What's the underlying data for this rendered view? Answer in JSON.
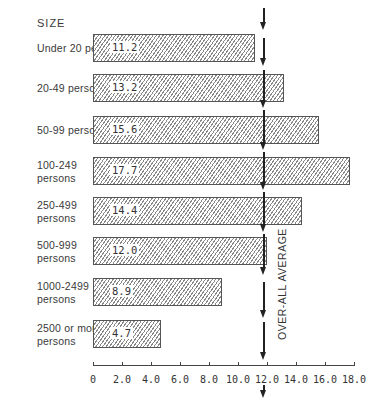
{
  "chart_data": {
    "type": "bar",
    "orientation": "horizontal",
    "title": "SIZE",
    "xlabel": "",
    "ylabel": "SIZE",
    "categories": [
      "Under 20 persons",
      "20-49 persons",
      "50-99 persons",
      "100-249 persons",
      "250-499 persons",
      "500-999 persons",
      "1000-2499 persons",
      "2500 or more persons"
    ],
    "values": [
      11.2,
      13.2,
      15.6,
      17.7,
      14.4,
      12.0,
      8.9,
      4.7
    ],
    "value_labels": [
      "11.2",
      "13.2",
      "15.6",
      "17.7",
      "14.4",
      "12.0",
      "8.9",
      "4.7"
    ],
    "xlim": [
      0,
      18.0
    ],
    "xticks": [
      "0",
      "2.0",
      "4.0",
      "6.0",
      "8.0",
      "10.0",
      "12.0",
      "14.0",
      "16.0",
      "18.0"
    ],
    "reference_line": {
      "label": "OVER-ALL AVERAGE",
      "value": 11.7
    },
    "grid": false,
    "legend": null,
    "bar_fill": "diagonal-hatch"
  },
  "labels": {
    "title": "SIZE",
    "rows": [
      {
        "line1": "Under 20 persons",
        "line2": ""
      },
      {
        "line1": "20-49 persons",
        "line2": ""
      },
      {
        "line1": "50-99 persons",
        "line2": ""
      },
      {
        "line1": "100-249",
        "line2": "persons"
      },
      {
        "line1": "250-499",
        "line2": "persons"
      },
      {
        "line1": "500-999",
        "line2": "persons"
      },
      {
        "line1": "1000-2499",
        "line2": "persons"
      },
      {
        "line1": "2500 or more",
        "line2": "persons"
      }
    ],
    "avg_label": "OVER-ALL AVERAGE"
  }
}
